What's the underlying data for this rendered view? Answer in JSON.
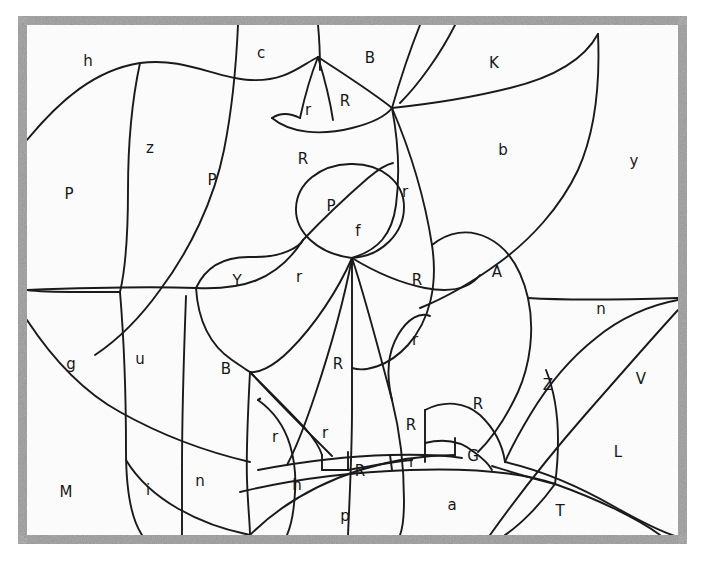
{
  "figure": {
    "kind": "planar-map-diagram",
    "title": "",
    "width": 705,
    "height": 567,
    "colors": {
      "background": "#ffffff",
      "canvas": "#fbfbfb",
      "frame": "#9a9a9a",
      "stroke": "#1a1a1a",
      "label": "#17171a"
    },
    "frame": {
      "x": 18,
      "y": 16,
      "width": 669,
      "height": 528,
      "border_width": 9,
      "texture": "speckled-gray"
    }
  },
  "chart_data": {
    "type": "diagram",
    "title": "",
    "xlabel": "",
    "ylabel": "",
    "grid": false,
    "legend": "none",
    "region_count": 45,
    "labels": [
      {
        "text": "h",
        "x": 88,
        "y": 61
      },
      {
        "text": "c",
        "x": 261,
        "y": 53
      },
      {
        "text": "B",
        "x": 370,
        "y": 58
      },
      {
        "text": "K",
        "x": 494,
        "y": 63
      },
      {
        "text": "r",
        "x": 308,
        "y": 110
      },
      {
        "text": "R",
        "x": 345,
        "y": 101
      },
      {
        "text": "z",
        "x": 150,
        "y": 148
      },
      {
        "text": "P",
        "x": 212,
        "y": 180
      },
      {
        "text": "R",
        "x": 303,
        "y": 159
      },
      {
        "text": "b",
        "x": 503,
        "y": 150
      },
      {
        "text": "y",
        "x": 634,
        "y": 161
      },
      {
        "text": "P",
        "x": 69,
        "y": 194
      },
      {
        "text": "P",
        "x": 331,
        "y": 206
      },
      {
        "text": "r",
        "x": 405,
        "y": 192
      },
      {
        "text": "f",
        "x": 358,
        "y": 231
      },
      {
        "text": "Y",
        "x": 237,
        "y": 281
      },
      {
        "text": "r",
        "x": 299,
        "y": 277
      },
      {
        "text": "R",
        "x": 417,
        "y": 280
      },
      {
        "text": "A",
        "x": 497,
        "y": 272
      },
      {
        "text": "n",
        "x": 601,
        "y": 309
      },
      {
        "text": "g",
        "x": 71,
        "y": 364
      },
      {
        "text": "u",
        "x": 140,
        "y": 359
      },
      {
        "text": "B",
        "x": 226,
        "y": 369
      },
      {
        "text": "R",
        "x": 338,
        "y": 364
      },
      {
        "text": "r",
        "x": 415,
        "y": 340
      },
      {
        "text": "Z",
        "x": 548,
        "y": 385
      },
      {
        "text": "V",
        "x": 641,
        "y": 379
      },
      {
        "text": "R",
        "x": 478,
        "y": 404
      },
      {
        "text": "R",
        "x": 411,
        "y": 425
      },
      {
        "text": "r",
        "x": 275,
        "y": 437
      },
      {
        "text": "r",
        "x": 325,
        "y": 433
      },
      {
        "text": "G",
        "x": 473,
        "y": 456
      },
      {
        "text": "L",
        "x": 618,
        "y": 452
      },
      {
        "text": "n",
        "x": 200,
        "y": 481
      },
      {
        "text": "i",
        "x": 148,
        "y": 490
      },
      {
        "text": "M",
        "x": 66,
        "y": 492
      },
      {
        "text": "h",
        "x": 297,
        "y": 485
      },
      {
        "text": "R",
        "x": 360,
        "y": 471
      },
      {
        "text": "r",
        "x": 412,
        "y": 462
      },
      {
        "text": "p",
        "x": 345,
        "y": 516
      },
      {
        "text": "a",
        "x": 452,
        "y": 505
      },
      {
        "text": "T",
        "x": 560,
        "y": 511
      }
    ]
  }
}
